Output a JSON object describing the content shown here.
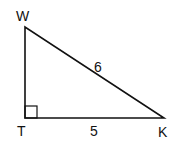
{
  "diagram": {
    "type": "right-triangle",
    "vertices": {
      "W": {
        "label": "W",
        "x": 25,
        "y": 27
      },
      "T": {
        "label": "T",
        "x": 25,
        "y": 118
      },
      "K": {
        "label": "K",
        "x": 164,
        "y": 118
      }
    },
    "right_angle_at": "T",
    "sides": {
      "WK": {
        "label": "6"
      },
      "TK": {
        "label": "5"
      }
    },
    "colors": {
      "stroke": "#111111",
      "background": "#ffffff"
    }
  }
}
